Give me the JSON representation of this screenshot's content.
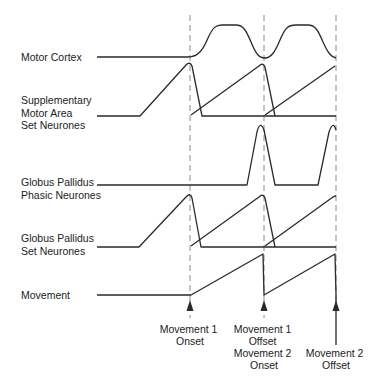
{
  "diagram": {
    "rows": [
      {
        "id": "motor-cortex",
        "label_lines": [
          "Motor Cortex"
        ]
      },
      {
        "id": "sma-set",
        "label_lines": [
          "Supplementary",
          "Motor Area",
          "Set Neurones"
        ]
      },
      {
        "id": "gp-phasic",
        "label_lines": [
          "Globus Pallidus",
          "Phasic Neurones"
        ]
      },
      {
        "id": "gp-set",
        "label_lines": [
          "Globus Pallidus",
          "Set Neurones"
        ]
      },
      {
        "id": "movement",
        "label_lines": [
          "Movement"
        ]
      }
    ],
    "events": [
      {
        "id": "m1-onset",
        "label_lines": [
          "Movement 1",
          "Onset"
        ]
      },
      {
        "id": "m1-offset-m2-onset",
        "label_lines": [
          "Movement 1",
          "Offset",
          "Movement 2",
          "Onset"
        ]
      },
      {
        "id": "m2-offset",
        "label_lines": [
          "Movement 2",
          "Offset"
        ]
      }
    ],
    "colors": {
      "trace": "#2a2a2a",
      "dashed_marker": "#8a8a8a",
      "text": "#222222",
      "background": "#ffffff"
    }
  }
}
